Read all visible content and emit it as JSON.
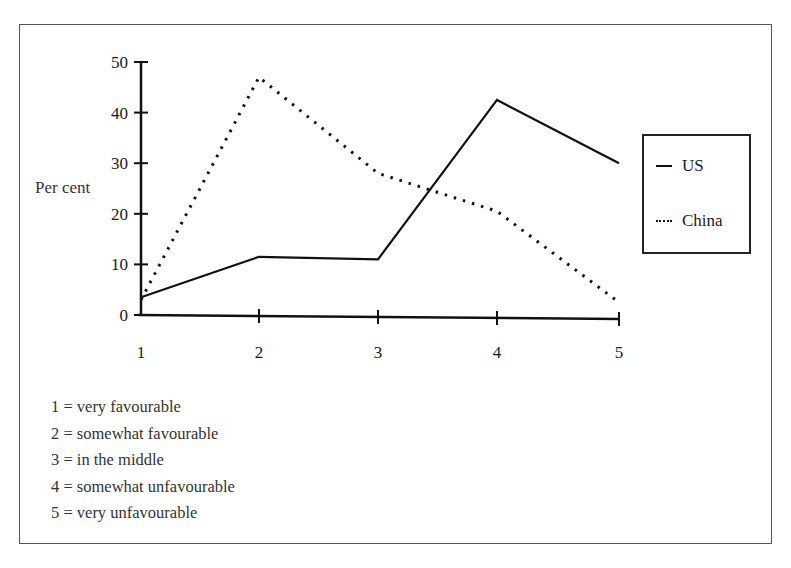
{
  "chart_data": {
    "type": "line",
    "title": "",
    "xlabel": "",
    "ylabel": "Per cent",
    "x": [
      1,
      2,
      3,
      4,
      5
    ],
    "categories": [
      "1",
      "2",
      "3",
      "4",
      "5"
    ],
    "ylim": [
      0,
      50
    ],
    "yticks": [
      0,
      10,
      20,
      30,
      40,
      50
    ],
    "grid": false,
    "legend_position": "right",
    "series": [
      {
        "name": "US",
        "style": "solid",
        "values": [
          3.5,
          11.5,
          11,
          42.5,
          30
        ]
      },
      {
        "name": "China",
        "style": "dotted",
        "values": [
          3,
          47,
          28,
          20.5,
          2.5
        ]
      }
    ],
    "annotations": [
      "1 = very favourable",
      "2 = somewhat favourable",
      "3 = in the middle",
      "4 = somewhat unfavourable",
      "5 = very unfavourable"
    ]
  },
  "legend": {
    "items": [
      {
        "label": "US",
        "style": "solid"
      },
      {
        "label": "China",
        "style": "dotted"
      }
    ]
  }
}
